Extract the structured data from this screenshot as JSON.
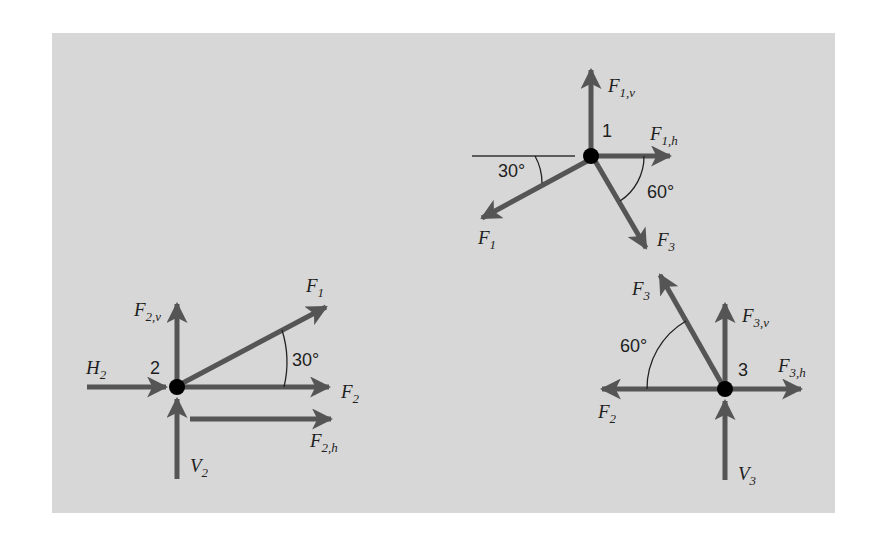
{
  "diagram": {
    "colors": {
      "background": "#d7d7d7",
      "arrow": "#555555",
      "node": "#000000",
      "text": "#1e1e1e",
      "page": "#ffffff"
    },
    "nodes": [
      {
        "id": "1",
        "label": "1",
        "x": 591,
        "y": 156,
        "forces": [
          {
            "name": "F1,v",
            "main": "F",
            "sub": "1,v",
            "direction": "up",
            "angle_deg": 90
          },
          {
            "name": "F1,h",
            "main": "F",
            "sub": "1,h",
            "direction": "right",
            "angle_deg": 0
          },
          {
            "name": "F1",
            "main": "F",
            "sub": "1",
            "direction": "down-left",
            "angle_from_horizontal_deg": 30
          },
          {
            "name": "F3",
            "main": "F",
            "sub": "3",
            "direction": "down-right",
            "angle_from_horizontal_deg": 60
          }
        ],
        "angles": [
          {
            "label": "30°",
            "between": [
              "reference-horizontal",
              "F1"
            ]
          },
          {
            "label": "60°",
            "between": [
              "F1,h",
              "F3"
            ]
          }
        ]
      },
      {
        "id": "2",
        "label": "2",
        "x": 177,
        "y": 387,
        "forces": [
          {
            "name": "F2,v",
            "main": "F",
            "sub": "2,v",
            "direction": "up"
          },
          {
            "name": "H2",
            "main": "H",
            "sub": "2",
            "direction": "right (incoming)"
          },
          {
            "name": "F1",
            "main": "F",
            "sub": "1",
            "direction": "up-right",
            "angle_from_horizontal_deg": 30
          },
          {
            "name": "F2",
            "main": "F",
            "sub": "2",
            "direction": "right"
          },
          {
            "name": "F2,h",
            "main": "F",
            "sub": "2,h",
            "direction": "right (offset)"
          },
          {
            "name": "V2",
            "main": "V",
            "sub": "2",
            "direction": "up (incoming)"
          }
        ],
        "angles": [
          {
            "label": "30°",
            "between": [
              "F2",
              "F1"
            ]
          }
        ]
      },
      {
        "id": "3",
        "label": "3",
        "x": 725,
        "y": 389,
        "forces": [
          {
            "name": "F3",
            "main": "F",
            "sub": "3",
            "direction": "up-left",
            "angle_from_horizontal_deg": 60
          },
          {
            "name": "F3,v",
            "main": "F",
            "sub": "3,v",
            "direction": "up"
          },
          {
            "name": "F3,h",
            "main": "F",
            "sub": "3,h",
            "direction": "right"
          },
          {
            "name": "F2",
            "main": "F",
            "sub": "2",
            "direction": "left"
          },
          {
            "name": "V3",
            "main": "V",
            "sub": "3",
            "direction": "up (incoming)"
          }
        ],
        "angles": [
          {
            "label": "60°",
            "between": [
              "F2",
              "F3"
            ]
          }
        ]
      }
    ],
    "labels": {
      "n1": "1",
      "n2": "2",
      "n3": "3",
      "F": "F",
      "H": "H",
      "V": "V",
      "s1v": "1,v",
      "s1h": "1,h",
      "s1": "1",
      "s3": "3",
      "s2v": "2,v",
      "s2": "2",
      "s2h": "2,h",
      "s3v": "3,v",
      "s3h": "3,h",
      "a30": "30°",
      "a60": "60°"
    }
  }
}
